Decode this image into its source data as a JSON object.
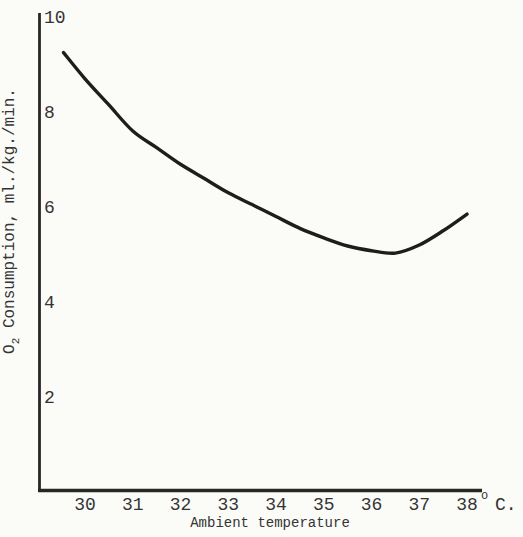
{
  "figure": {
    "background_color": "#fbfbf8",
    "ink_color": "#262626",
    "curve_color": "#1d1d1d"
  },
  "chart_data": {
    "type": "line",
    "title": "",
    "xlabel": "Ambient temperature",
    "ylabel": "O2 Consumption, ml./kg./min.",
    "ylabel_parts": {
      "base": "O",
      "sub": "2",
      "rest": " Consumption, ml./kg./min."
    },
    "x_ticks": [
      "30",
      "31",
      "32",
      "33",
      "34",
      "35",
      "36",
      "37",
      "38"
    ],
    "x_unit_suffix": {
      "sup": "o",
      "text": "C."
    },
    "y_ticks": [
      "10",
      "8",
      "6",
      "4",
      "2"
    ],
    "xlim": [
      29.0,
      38.5
    ],
    "ylim": [
      0,
      10
    ],
    "grid": false,
    "legend": null,
    "series": [
      {
        "name": "O2 consumption vs ambient temperature",
        "x": [
          29.55,
          30,
          30.5,
          31,
          31.5,
          32,
          32.5,
          33,
          33.5,
          34,
          34.5,
          35,
          35.5,
          36,
          36.5,
          37,
          37.5,
          38
        ],
        "y": [
          9.25,
          8.7,
          8.15,
          7.6,
          7.25,
          6.9,
          6.6,
          6.3,
          6.05,
          5.8,
          5.55,
          5.35,
          5.18,
          5.08,
          5.03,
          5.2,
          5.5,
          5.85
        ]
      }
    ]
  }
}
